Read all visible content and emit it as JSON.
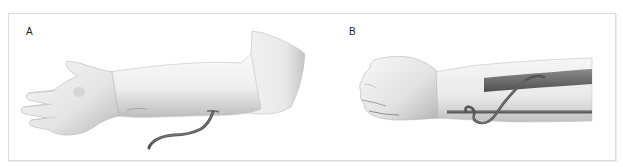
{
  "figure": {
    "panels": [
      {
        "label": "A",
        "description": "Extended arm with palm up; catheter tube emerging from the inner forearm near the elbow",
        "illustration": "arm-with-catheter-icon"
      },
      {
        "label": "B",
        "description": "Clenched fist forearm showing catheter looping between two vessels",
        "illustration": "forearm-vessel-loop-icon"
      }
    ],
    "colors": {
      "frame_border": "#dcdcdc",
      "skin_light": "#f4f4f4",
      "skin_shade": "#c9c9c9",
      "vessel": "#6e6e6e",
      "catheter": "#555555",
      "label_text": "#222222"
    }
  }
}
